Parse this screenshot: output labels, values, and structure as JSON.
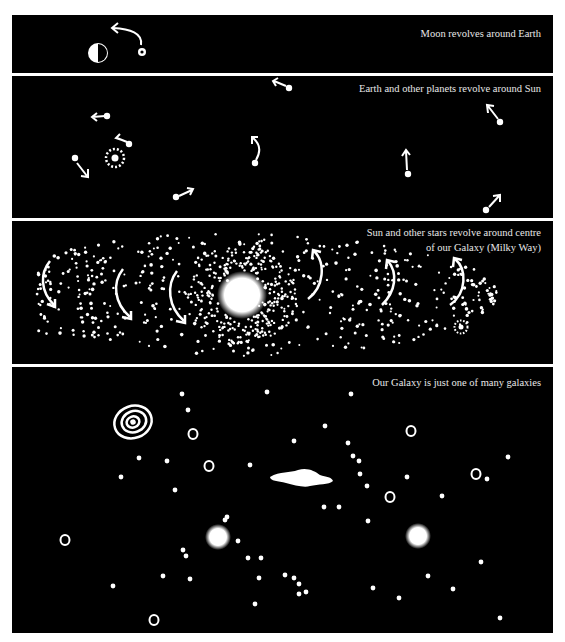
{
  "panels": [
    {
      "id": "moon-earth",
      "caption_lines": [
        "Moon revolves around Earth"
      ]
    },
    {
      "id": "planets-sun",
      "caption_lines": [
        "Earth and other planets revolve around Sun"
      ]
    },
    {
      "id": "stars-galaxy",
      "caption_lines": [
        "Sun and other stars revolve around centre",
        "of our Galaxy (Milky Way)"
      ]
    },
    {
      "id": "galaxies",
      "caption_lines": [
        "Our Galaxy is just one of many galaxies"
      ]
    }
  ],
  "colors": {
    "background": "#000000",
    "foreground": "#ffffff",
    "gutter": "#ffffff"
  }
}
